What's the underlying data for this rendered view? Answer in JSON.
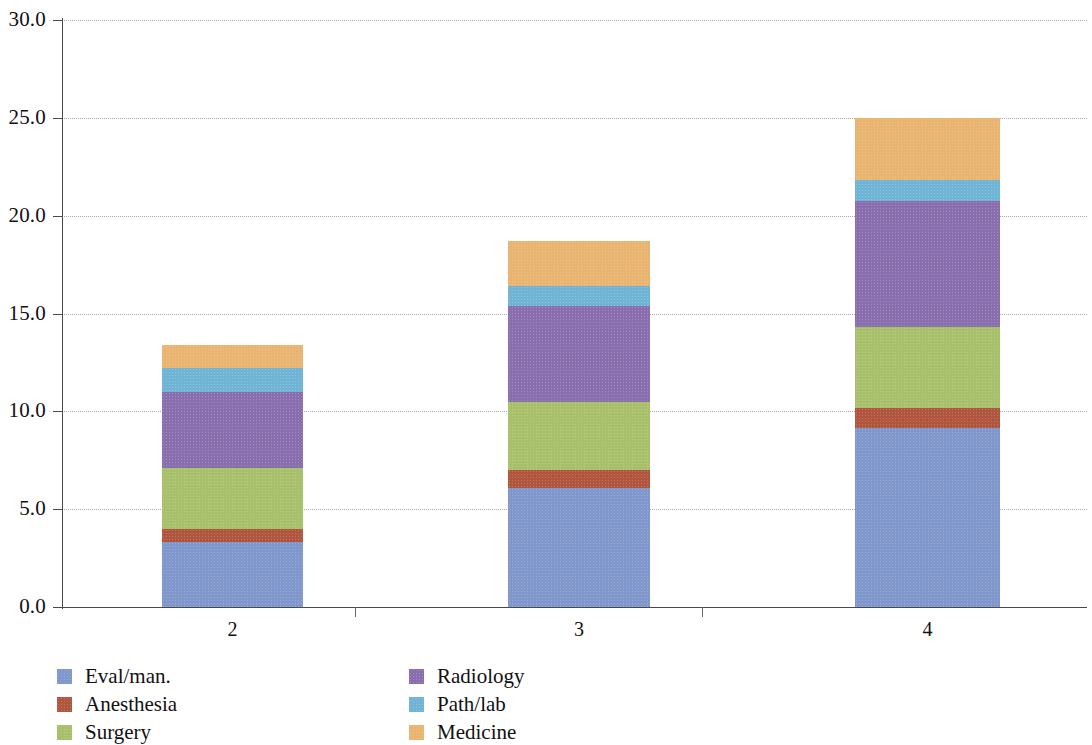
{
  "chart_data": {
    "type": "bar",
    "subtype": "stacked-bar",
    "title": "",
    "xlabel": "",
    "ylabel": "",
    "categories": [
      "2",
      "3",
      "4"
    ],
    "ylim": [
      0.0,
      30.0
    ],
    "ytick_values": [
      0.0,
      5.0,
      10.0,
      15.0,
      20.0,
      25.0,
      30.0
    ],
    "ytick_labels": [
      "0.0",
      "5.0",
      "10.0",
      "15.0",
      "20.0",
      "25.0",
      "30.0"
    ],
    "grid": "horizontal-dotted",
    "legend_position": "bottom-left",
    "stack_order_bottom_to_top": [
      "Eval/man.",
      "Anesthesia",
      "Surgery",
      "Radiology",
      "Path/lab",
      "Medicine"
    ],
    "series": [
      {
        "name": "Eval/man.",
        "color": "#8097cc",
        "values": [
          3.3,
          6.1,
          9.15
        ]
      },
      {
        "name": "Anesthesia",
        "color": "#b0553e",
        "values": [
          0.7,
          0.9,
          1.0
        ]
      },
      {
        "name": "Surgery",
        "color": "#a8c06a",
        "values": [
          3.1,
          3.5,
          4.15
        ]
      },
      {
        "name": "Radiology",
        "color": "#8a6fae",
        "values": [
          3.9,
          4.9,
          6.45
        ]
      },
      {
        "name": "Path/lab",
        "color": "#6fb4d4",
        "values": [
          1.2,
          1.0,
          1.05
        ]
      },
      {
        "name": "Medicine",
        "color": "#e8b470",
        "values": [
          1.2,
          2.3,
          3.2
        ]
      }
    ],
    "totals": [
      13.4,
      18.7,
      25.0
    ]
  },
  "legend": {
    "columns": [
      {
        "items": [
          {
            "label": "Eval/man.",
            "color": "#8097cc"
          },
          {
            "label": "Anesthesia",
            "color": "#b0553e"
          },
          {
            "label": "Surgery",
            "color": "#a8c06a"
          }
        ]
      },
      {
        "items": [
          {
            "label": "Radiology",
            "color": "#8a6fae"
          },
          {
            "label": "Path/lab",
            "color": "#6fb4d4"
          },
          {
            "label": "Medicine",
            "color": "#e8b470"
          }
        ]
      }
    ]
  },
  "axes": {
    "y_axis_color": "#4a4a4a",
    "x_axis_color": "#4a4a4a",
    "gridline_color": "#9a9a9a"
  }
}
